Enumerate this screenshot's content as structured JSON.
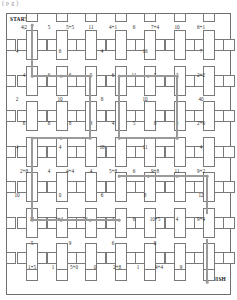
{
  "caption": {
    "text": "( p   g    )"
  },
  "puzzle": {
    "start_label": "START",
    "finish_label": "FINISH",
    "type": "number-maze-grid",
    "columns": 7,
    "rows": 7,
    "accent_path_color": "#9a9a9a",
    "line_color": "#7a7a7a",
    "labels_row_0": [
      "4|2",
      "5",
      "5+5",
      "11",
      "4+1",
      "6",
      "7+4",
      "10",
      "6+1"
    ],
    "labels_row_1": [
      "4",
      "6",
      "4",
      "16",
      "7"
    ],
    "labels_row_2": [
      "4",
      "6",
      "6",
      "5",
      "6",
      "11",
      "5",
      "2",
      "2+2"
    ],
    "labels_row_3": [
      "2",
      "10",
      "8",
      "10",
      "40"
    ],
    "labels_row_4": [
      "6",
      "6",
      "8",
      "3",
      "4",
      "5",
      "8",
      "8",
      "2+6"
    ],
    "labels_row_5": [
      "4",
      "4",
      "18",
      "11",
      "8",
      "4"
    ],
    "labels_row_6": [
      "2+8",
      "4",
      "4+4",
      "4",
      "5+8",
      "6",
      "9+8",
      "11",
      "9+2"
    ],
    "labels_row_7": [
      "10",
      "0",
      "6",
      "8",
      "12"
    ],
    "labels_row_8": [
      "11",
      "4+4",
      "14",
      "4",
      "6",
      "10+5",
      "4",
      "9+4"
    ],
    "labels_row_9": [
      "5",
      "9",
      "6",
      "8"
    ],
    "labels_row_10": [
      "1+5",
      "1",
      "5+0",
      "0",
      "2+8",
      "1",
      "4+4",
      "9"
    ]
  },
  "grid_labels": {
    "r0": [
      {
        "x": 17,
        "y": 13,
        "t": "4|2"
      },
      {
        "x": 42,
        "y": 13,
        "t": "5"
      },
      {
        "x": 63,
        "y": 13,
        "t": "5+5"
      },
      {
        "x": 84,
        "y": 13,
        "t": "11"
      },
      {
        "x": 106,
        "y": 13,
        "t": "4+1"
      },
      {
        "x": 127,
        "y": 13,
        "t": "6"
      },
      {
        "x": 148,
        "y": 13,
        "t": "7+4"
      },
      {
        "x": 170,
        "y": 13,
        "t": "10"
      },
      {
        "x": 194,
        "y": 13,
        "t": "6+1"
      }
    ],
    "r1": [
      {
        "x": 10,
        "y": 37,
        "t": "4"
      },
      {
        "x": 53,
        "y": 37,
        "t": "6"
      },
      {
        "x": 95,
        "y": 37,
        "t": "4"
      },
      {
        "x": 138,
        "y": 37,
        "t": "16"
      },
      {
        "x": 194,
        "y": 37,
        "t": "7"
      }
    ],
    "r2": [
      {
        "x": 17,
        "y": 61,
        "t": "4"
      },
      {
        "x": 42,
        "y": 61,
        "t": "6"
      },
      {
        "x": 63,
        "y": 61,
        "t": "6"
      },
      {
        "x": 84,
        "y": 61,
        "t": "5"
      },
      {
        "x": 106,
        "y": 61,
        "t": "6"
      },
      {
        "x": 127,
        "y": 61,
        "t": "11"
      },
      {
        "x": 148,
        "y": 61,
        "t": "5"
      },
      {
        "x": 170,
        "y": 61,
        "t": "2"
      },
      {
        "x": 194,
        "y": 61,
        "t": "2+2"
      }
    ],
    "r3": [
      {
        "x": 10,
        "y": 85,
        "t": "2"
      },
      {
        "x": 53,
        "y": 85,
        "t": "10"
      },
      {
        "x": 95,
        "y": 85,
        "t": "8"
      },
      {
        "x": 138,
        "y": 85,
        "t": "10"
      },
      {
        "x": 194,
        "y": 85,
        "t": "40"
      }
    ],
    "r4": [
      {
        "x": 17,
        "y": 109,
        "t": "6"
      },
      {
        "x": 42,
        "y": 109,
        "t": "6"
      },
      {
        "x": 63,
        "y": 109,
        "t": "8"
      },
      {
        "x": 84,
        "y": 109,
        "t": "3"
      },
      {
        "x": 106,
        "y": 109,
        "t": "4"
      },
      {
        "x": 127,
        "y": 109,
        "t": "5"
      },
      {
        "x": 148,
        "y": 109,
        "t": "8"
      },
      {
        "x": 170,
        "y": 109,
        "t": "8"
      },
      {
        "x": 194,
        "y": 109,
        "t": "2+6"
      }
    ],
    "r5": [
      {
        "x": 10,
        "y": 133,
        "t": "4"
      },
      {
        "x": 53,
        "y": 133,
        "t": "4"
      },
      {
        "x": 95,
        "y": 133,
        "t": "18"
      },
      {
        "x": 138,
        "y": 133,
        "t": "11"
      },
      {
        "x": 194,
        "y": 133,
        "t": "4"
      }
    ],
    "r6": [
      {
        "x": 17,
        "y": 157,
        "t": "2+8"
      },
      {
        "x": 42,
        "y": 157,
        "t": "4"
      },
      {
        "x": 63,
        "y": 157,
        "t": "4+4"
      },
      {
        "x": 84,
        "y": 157,
        "t": "4"
      },
      {
        "x": 106,
        "y": 157,
        "t": "5+8"
      },
      {
        "x": 127,
        "y": 157,
        "t": "6"
      },
      {
        "x": 148,
        "y": 157,
        "t": "9+8"
      },
      {
        "x": 170,
        "y": 157,
        "t": "11"
      },
      {
        "x": 194,
        "y": 157,
        "t": "9+2"
      }
    ],
    "r7": [
      {
        "x": 10,
        "y": 181,
        "t": "10"
      },
      {
        "x": 53,
        "y": 181,
        "t": "0"
      },
      {
        "x": 95,
        "y": 181,
        "t": "6"
      },
      {
        "x": 138,
        "y": 181,
        "t": "8"
      },
      {
        "x": 194,
        "y": 181,
        "t": "12"
      }
    ],
    "r8": [
      {
        "x": 25,
        "y": 205,
        "t": "11"
      },
      {
        "x": 52,
        "y": 205,
        "t": "4+4"
      },
      {
        "x": 78,
        "y": 205,
        "t": "14"
      },
      {
        "x": 106,
        "y": 205,
        "t": "4"
      },
      {
        "x": 127,
        "y": 205,
        "t": "6"
      },
      {
        "x": 148,
        "y": 205,
        "t": "10+5"
      },
      {
        "x": 170,
        "y": 205,
        "t": "4"
      },
      {
        "x": 194,
        "y": 205,
        "t": "9+4"
      }
    ],
    "r9": [
      {
        "x": 25,
        "y": 229,
        "t": "5"
      },
      {
        "x": 63,
        "y": 229,
        "t": "9"
      },
      {
        "x": 106,
        "y": 229,
        "t": "6"
      },
      {
        "x": 148,
        "y": 229,
        "t": "8"
      }
    ],
    "r10": [
      {
        "x": 25,
        "y": 253,
        "t": "1+5"
      },
      {
        "x": 46,
        "y": 253,
        "t": "1"
      },
      {
        "x": 67,
        "y": 253,
        "t": "5+0"
      },
      {
        "x": 88,
        "y": 253,
        "t": "0"
      },
      {
        "x": 110,
        "y": 253,
        "t": "2+8"
      },
      {
        "x": 131,
        "y": 253,
        "t": "1"
      },
      {
        "x": 152,
        "y": 253,
        "t": "4+4"
      },
      {
        "x": 174,
        "y": 253,
        "t": "9"
      }
    ]
  }
}
